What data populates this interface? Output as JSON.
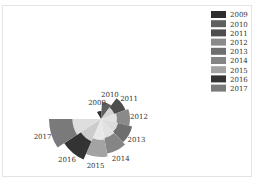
{
  "chart_data": {
    "type": "polar-bar",
    "title": "",
    "categories": [
      "2009",
      "2010",
      "2011",
      "2012",
      "2013",
      "2014",
      "2015",
      "2016",
      "2017"
    ],
    "values": [
      8,
      17,
      26,
      29,
      32,
      35,
      38,
      44,
      52
    ],
    "colors": [
      "#2e2e2e",
      "#5f5f5f",
      "#4d4d4d",
      "#8a8a8a",
      "#6e6e6e",
      "#858585",
      "#a3a3a3",
      "#333333",
      "#7a7a7a"
    ],
    "start_angle_deg": -120,
    "end_angle_deg": 180,
    "legend_position": "top-right",
    "legend": [
      "2009",
      "2010",
      "2011",
      "2012",
      "2013",
      "2014",
      "2015",
      "2016",
      "2017"
    ]
  }
}
